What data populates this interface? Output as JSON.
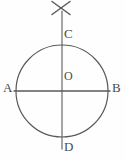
{
  "diagram": {
    "stroke_color": "#5a5a5a",
    "label_color": "#4a4a4a",
    "background_color": "#fefefe",
    "circle": {
      "center_x": 62,
      "center_y": 91,
      "radius": 46
    },
    "labels": {
      "A": "A",
      "B": "B",
      "C": "C",
      "D": "D",
      "O": "O"
    },
    "points": {
      "A": {
        "name": "A",
        "x": 16,
        "y": 91,
        "role": "left-endpoint-horizontal-diameter"
      },
      "B": {
        "name": "B",
        "x": 108,
        "y": 91,
        "role": "right-endpoint-horizontal-diameter"
      },
      "C": {
        "name": "C",
        "x": 62,
        "y": 45,
        "role": "top-endpoint-vertical-diameter"
      },
      "D": {
        "name": "D",
        "x": 62,
        "y": 137,
        "role": "bottom-endpoint-vertical-diameter"
      },
      "O": {
        "name": "O",
        "x": 62,
        "y": 91,
        "role": "center"
      }
    },
    "segments": {
      "horizontal_diameter": {
        "name": "AB",
        "x1": 14,
        "y1": 91,
        "x2": 110,
        "y2": 91
      },
      "vertical_line": {
        "name": "CD extended",
        "x1": 62,
        "y1": 11,
        "x2": 62,
        "y2": 149
      }
    },
    "cross_mark": {
      "name": "x-mark",
      "center_x": 61,
      "center_y": 8,
      "arm": 9,
      "stroke1": {
        "x1": 52,
        "y1": 1,
        "x2": 70,
        "y2": 15
      },
      "stroke2": {
        "x1": 70,
        "y1": 1,
        "x2": 52,
        "y2": 15
      }
    }
  }
}
